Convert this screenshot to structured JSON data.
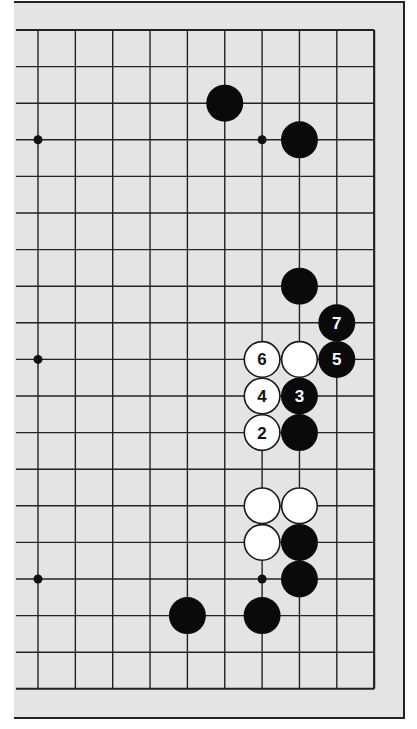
{
  "diagram": {
    "type": "go-board-fragment",
    "grid": {
      "columns": 10,
      "rows": 19,
      "x0": 38,
      "y0": 30,
      "dx": 37.35,
      "dy": 36.6,
      "right_edge_is_board_edge": true,
      "left_edge_extends": true
    },
    "colors": {
      "board_background": "#e4e4e4",
      "line": "#222222",
      "black_stone": "#0a0a0a",
      "white_stone": "#ffffff",
      "frame": "#222222"
    },
    "hoshi": [
      {
        "col": 0,
        "row": 3
      },
      {
        "col": 6,
        "row": 3
      },
      {
        "col": 0,
        "row": 9
      },
      {
        "col": 0,
        "row": 15
      },
      {
        "col": 6,
        "row": 15
      }
    ],
    "stones": [
      {
        "color": "black",
        "col": 5,
        "row": 2,
        "label": ""
      },
      {
        "color": "black",
        "col": 7,
        "row": 3,
        "label": ""
      },
      {
        "color": "black",
        "col": 7,
        "row": 7,
        "label": ""
      },
      {
        "color": "black",
        "col": 8,
        "row": 8,
        "label": "7"
      },
      {
        "color": "white",
        "col": 6,
        "row": 9,
        "label": "6"
      },
      {
        "color": "white",
        "col": 7,
        "row": 9,
        "label": ""
      },
      {
        "color": "black",
        "col": 8,
        "row": 9,
        "label": "5"
      },
      {
        "color": "white",
        "col": 6,
        "row": 10,
        "label": "4"
      },
      {
        "color": "black",
        "col": 7,
        "row": 10,
        "label": "3"
      },
      {
        "color": "white",
        "col": 6,
        "row": 11,
        "label": "2"
      },
      {
        "color": "black",
        "col": 7,
        "row": 11,
        "label": ""
      },
      {
        "color": "white",
        "col": 6,
        "row": 13,
        "label": ""
      },
      {
        "color": "white",
        "col": 7,
        "row": 13,
        "label": ""
      },
      {
        "color": "white",
        "col": 6,
        "row": 14,
        "label": ""
      },
      {
        "color": "black",
        "col": 7,
        "row": 14,
        "label": ""
      },
      {
        "color": "black",
        "col": 7,
        "row": 15,
        "label": ""
      },
      {
        "color": "black",
        "col": 4,
        "row": 16,
        "label": ""
      },
      {
        "color": "black",
        "col": 6,
        "row": 16,
        "label": ""
      }
    ]
  }
}
